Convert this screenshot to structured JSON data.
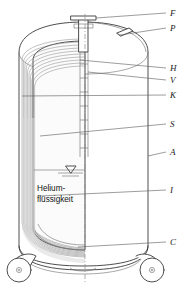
{
  "figure": {
    "width": 191,
    "height": 292,
    "background": "#ffffff",
    "line_color": "#3a3a3a",
    "label_color": "#1a1a1a"
  },
  "callouts": [
    {
      "key": "F",
      "label": "F",
      "y": 14
    },
    {
      "key": "P",
      "label": "P",
      "y": 29
    },
    {
      "key": "H",
      "label": "H",
      "y": 69
    },
    {
      "key": "V",
      "label": "V",
      "y": 81
    },
    {
      "key": "K",
      "label": "K",
      "y": 96
    },
    {
      "key": "S",
      "label": "S",
      "y": 125
    },
    {
      "key": "A",
      "label": "A",
      "y": 153
    },
    {
      "key": "I",
      "label": "I",
      "y": 191
    },
    {
      "key": "C",
      "label": "C",
      "y": 243
    }
  ],
  "annotations": {
    "liquid_label_line1": "Helium-",
    "liquid_label_line2": "flüssigkeit",
    "level_symbol": "liquid-level-triangle"
  },
  "parts": {
    "neck_flange": "F",
    "pressure_port": "P",
    "outer_shell": "A",
    "inner_vessel": "I",
    "superinsulation": "S",
    "caster_wheels": "C",
    "neck_tube": "H",
    "vacuum_space": "V",
    "cold_shield": "K"
  },
  "icons": {
    "caster_left": "caster-wheel-icon",
    "caster_right": "caster-wheel-icon",
    "level_indicator": "liquid-level-icon"
  }
}
